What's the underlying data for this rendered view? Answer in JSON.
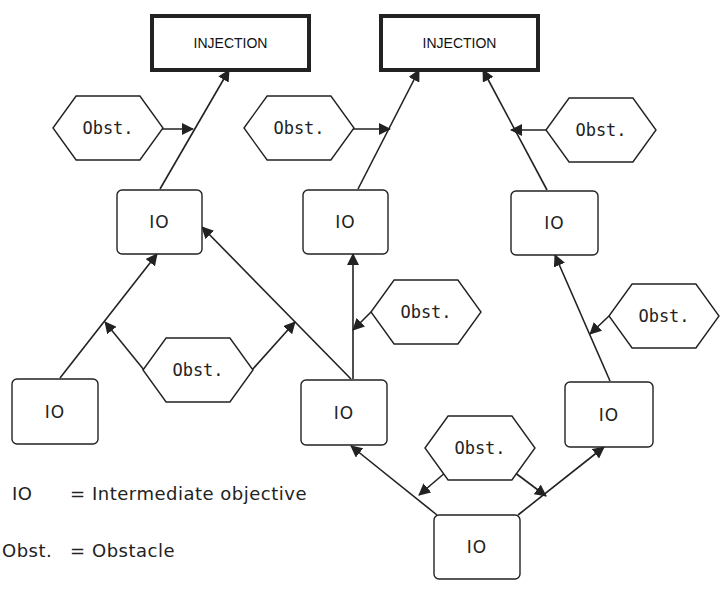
{
  "diagram": {
    "colors": {
      "stroke": "#222222",
      "fill": "#ffffff",
      "text": "#222222"
    },
    "injections": [
      {
        "id": "inj1",
        "label": "INJECTION",
        "x": 152,
        "y": 16,
        "w": 157,
        "h": 54
      },
      {
        "id": "inj2",
        "label": "INJECTION",
        "x": 381,
        "y": 16,
        "w": 157,
        "h": 54
      }
    ],
    "ios": [
      {
        "id": "io1",
        "label": "IO",
        "x": 117,
        "y": 190,
        "w": 85,
        "h": 64
      },
      {
        "id": "io2",
        "label": "IO",
        "x": 303,
        "y": 190,
        "w": 85,
        "h": 64
      },
      {
        "id": "io3",
        "label": "IO",
        "x": 511,
        "y": 191,
        "w": 87,
        "h": 64
      },
      {
        "id": "io4",
        "label": "IO",
        "x": 12,
        "y": 379,
        "w": 86,
        "h": 65
      },
      {
        "id": "io5",
        "label": "IO",
        "x": 301,
        "y": 380,
        "w": 86,
        "h": 65
      },
      {
        "id": "io6",
        "label": "IO",
        "x": 565,
        "y": 382,
        "w": 88,
        "h": 65
      },
      {
        "id": "io7",
        "label": "IO",
        "x": 434,
        "y": 515,
        "w": 86,
        "h": 64
      }
    ],
    "obstacles": [
      {
        "id": "ob1",
        "label": "Obst.",
        "cx": 108,
        "cy": 128,
        "w": 110,
        "h": 64
      },
      {
        "id": "ob2",
        "label": "Obst.",
        "cx": 299,
        "cy": 128,
        "w": 110,
        "h": 64
      },
      {
        "id": "ob3",
        "label": "Obst.",
        "cx": 601,
        "cy": 130,
        "w": 110,
        "h": 64
      },
      {
        "id": "ob4",
        "label": "Obst.",
        "cx": 426,
        "cy": 312,
        "w": 110,
        "h": 64
      },
      {
        "id": "ob5",
        "label": "Obst.",
        "cx": 664,
        "cy": 316,
        "w": 110,
        "h": 64
      },
      {
        "id": "ob6",
        "label": "Obst.",
        "cx": 198,
        "cy": 370,
        "w": 110,
        "h": 64
      },
      {
        "id": "ob7",
        "label": "Obst.",
        "cx": 480,
        "cy": 448,
        "w": 110,
        "h": 64
      }
    ],
    "edges": [
      {
        "from": [
          160,
          189
        ],
        "to": [
          229,
          70
        ],
        "arrow": true
      },
      {
        "from": [
          358,
          189
        ],
        "to": [
          419,
          70
        ],
        "arrow": true
      },
      {
        "from": [
          547,
          190
        ],
        "to": [
          483,
          70
        ],
        "arrow": true
      },
      {
        "from": [
          60,
          378
        ],
        "to": [
          157,
          254
        ],
        "arrow": true
      },
      {
        "from": [
          351,
          379
        ],
        "to": [
          202,
          227
        ],
        "arrow": true
      },
      {
        "from": [
          353,
          379
        ],
        "to": [
          353,
          254
        ],
        "arrow": true
      },
      {
        "from": [
          610,
          381
        ],
        "to": [
          555,
          255
        ],
        "arrow": true
      },
      {
        "from": [
          437,
          515
        ],
        "to": [
          351,
          446
        ],
        "arrow": true
      },
      {
        "from": [
          518,
          515
        ],
        "to": [
          604,
          447
        ],
        "arrow": true
      },
      {
        "from": [
          157,
          129
        ],
        "to": [
          193,
          129
        ],
        "arrow": true
      },
      {
        "from": [
          348,
          129
        ],
        "to": [
          390,
          129
        ],
        "arrow": true
      },
      {
        "from": [
          546,
          130
        ],
        "to": [
          511,
          130
        ],
        "arrow": true
      },
      {
        "from": [
          371,
          312
        ],
        "to": [
          353,
          330
        ],
        "arrow": true
      },
      {
        "from": [
          609,
          316
        ],
        "to": [
          590,
          334
        ],
        "arrow": true
      },
      {
        "from": [
          144,
          370
        ],
        "to": [
          105,
          322
        ],
        "arrow": true
      },
      {
        "from": [
          252,
          370
        ],
        "to": [
          295,
          322
        ],
        "arrow": true
      },
      {
        "from": [
          446,
          472
        ],
        "to": [
          419,
          495
        ],
        "arrow": true
      },
      {
        "from": [
          514,
          472
        ],
        "to": [
          546,
          496
        ],
        "arrow": true
      }
    ]
  },
  "legend": {
    "rows": [
      {
        "key": "IO",
        "separator": "=",
        "meaning": "Intermediate objective"
      },
      {
        "key": "Obst.",
        "separator": "=",
        "meaning": "Obstacle"
      }
    ]
  }
}
